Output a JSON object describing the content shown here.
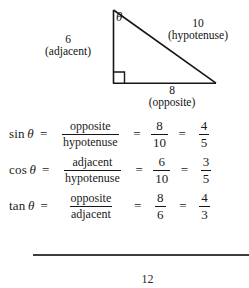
{
  "figure": {
    "name": "right-triangle-diagram",
    "angle_symbol": "θ",
    "vertices": {
      "apex": [
        113,
        10
      ],
      "bottom_left": [
        113,
        83
      ],
      "bottom_right": [
        215,
        83
      ]
    },
    "right_angle_marker": "bottom-left",
    "sides": [
      {
        "id": "adjacent",
        "value": "6",
        "role": "(adjacent)",
        "position": "left-vertical"
      },
      {
        "id": "hypotenuse",
        "value": "10",
        "role": "(hypotenuse)",
        "position": "diagonal"
      },
      {
        "id": "opposite",
        "value": "8",
        "role": "(opposite)",
        "position": "bottom-horizontal"
      }
    ]
  },
  "equations": [
    {
      "function": "sin",
      "theta": "θ",
      "equals": "=",
      "ratio": {
        "numerator": "opposite",
        "denominator": "hypotenuse"
      },
      "equals2": "=",
      "fraction": {
        "numerator": "8",
        "denominator": "10"
      },
      "equals3": "=",
      "simplified": {
        "numerator": "4",
        "denominator": "5"
      }
    },
    {
      "function": "cos",
      "theta": "θ",
      "equals": "=",
      "ratio": {
        "numerator": "adjacent",
        "denominator": "hypotenuse"
      },
      "equals2": "=",
      "fraction": {
        "numerator": "6",
        "denominator": "10"
      },
      "equals3": "=",
      "simplified": {
        "numerator": "3",
        "denominator": "5"
      }
    },
    {
      "function": "tan",
      "theta": "θ",
      "equals": "=",
      "ratio": {
        "numerator": "opposite",
        "denominator": "adjacent"
      },
      "equals2": "=",
      "fraction": {
        "numerator": "8",
        "denominator": "6"
      },
      "equals3": "=",
      "simplified": {
        "numerator": "4",
        "denominator": "3"
      }
    }
  ],
  "footer": {
    "page_number": "12"
  },
  "colors": {
    "ink": "#1a1a1a",
    "rule": "#3d3d3d",
    "background": "#ffffff"
  }
}
